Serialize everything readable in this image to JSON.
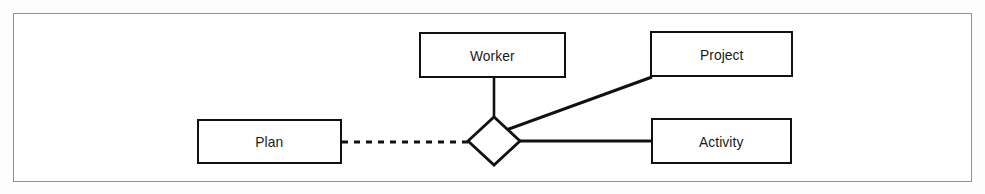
{
  "figure": {
    "kind": "entity-relationship-diagram",
    "notation": "chen-er",
    "frame": {
      "border_color": "#8d8f92",
      "background_color": "#ffffff"
    },
    "stroke_color": "#111111",
    "text_color": "#1a1a1a"
  },
  "entities": [
    {
      "id": "worker",
      "label": "Worker",
      "shape": "rectangle",
      "x": 419,
      "y": 32,
      "width": 147,
      "height": 46
    },
    {
      "id": "project",
      "label": "Project",
      "shape": "rectangle",
      "x": 650,
      "y": 31,
      "width": 143,
      "height": 46
    },
    {
      "id": "plan",
      "label": "Plan",
      "shape": "rectangle",
      "x": 197,
      "y": 119,
      "width": 145,
      "height": 45
    },
    {
      "id": "activity",
      "label": "Activity",
      "shape": "rectangle",
      "x": 651,
      "y": 118,
      "width": 141,
      "height": 46
    }
  ],
  "relationship": {
    "id": "relationship-diamond",
    "label": "",
    "shape": "diamond",
    "center_x": 494,
    "center_y": 141,
    "half_width": 26,
    "half_height": 24
  },
  "connectors": [
    {
      "id": "plan-to-relationship",
      "from": "plan",
      "to": "relationship-diamond",
      "style": "dashed",
      "x1": 342,
      "y1": 142,
      "x2": 468,
      "y2": 142
    },
    {
      "id": "worker-to-relationship",
      "from": "worker",
      "to": "relationship-diamond",
      "style": "solid",
      "x1": 494,
      "y1": 78,
      "x2": 494,
      "y2": 117
    },
    {
      "id": "relationship-to-project",
      "from": "relationship-diamond",
      "to": "project",
      "style": "solid",
      "x1": 507,
      "y1": 129,
      "x2": 651,
      "y2": 77
    },
    {
      "id": "relationship-to-activity",
      "from": "relationship-diamond",
      "to": "activity",
      "style": "solid",
      "x1": 519,
      "y1": 141,
      "x2": 651,
      "y2": 141
    }
  ]
}
